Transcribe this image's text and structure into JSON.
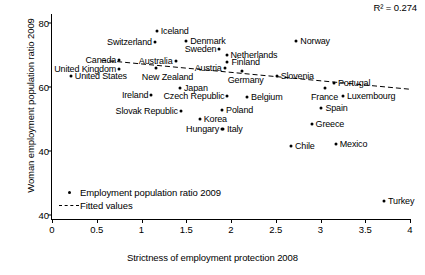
{
  "chart_data": {
    "type": "scatter",
    "title": "",
    "xlabel": "Strictness of employment protection 2008",
    "ylabel": "Woman employment population ratio 2009",
    "xlim": [
      0,
      4
    ],
    "ylim": [
      40,
      80
    ],
    "xticks": [
      "0",
      "0.5",
      "1",
      "1.5",
      "2",
      "2.5",
      "3",
      "3.5",
      "4"
    ],
    "xtick_values": [
      0,
      0.5,
      1,
      1.5,
      2,
      2.5,
      3,
      3.5,
      4
    ],
    "yticks": [
      "80",
      "60",
      "40",
      "40"
    ],
    "ytick_values": [
      80,
      60,
      40,
      20
    ],
    "grid": false,
    "annotation": "R² = 0.274",
    "legend_position": "bottom-left",
    "legend": [
      {
        "key": "marker",
        "label": "Employment population ratio 2009"
      },
      {
        "key": "dashed-line",
        "label": "Fitted values"
      }
    ],
    "series": [
      {
        "name": "Employment population ratio 2009",
        "points": [
          {
            "label": "Iceland",
            "x": 1.17,
            "y": 77.6,
            "label_side": "right"
          },
          {
            "label": "Switzerland",
            "x": 1.15,
            "y": 74.2,
            "label_side": "left"
          },
          {
            "label": "Denmark",
            "x": 1.5,
            "y": 74.4,
            "label_side": "right"
          },
          {
            "label": "Norway",
            "x": 2.73,
            "y": 74.4,
            "label_side": "right"
          },
          {
            "label": "Sweden",
            "x": 1.87,
            "y": 72.0,
            "label_side": "left"
          },
          {
            "label": "Netherlands",
            "x": 1.95,
            "y": 70.0,
            "label_side": "right"
          },
          {
            "label": "Canada",
            "x": 0.75,
            "y": 68.5,
            "label_side": "left"
          },
          {
            "label": "Australia",
            "x": 1.38,
            "y": 68.1,
            "label_side": "left"
          },
          {
            "label": "Finland",
            "x": 1.96,
            "y": 67.9,
            "label_side": "right"
          },
          {
            "label": "New Zealand",
            "x": 1.16,
            "y": 66.0,
            "label_side": "below"
          },
          {
            "label": "United Kingdom",
            "x": 0.75,
            "y": 65.5,
            "label_side": "left"
          },
          {
            "label": "Austria",
            "x": 1.93,
            "y": 66.0,
            "label_side": "left"
          },
          {
            "label": "Germany",
            "x": 2.12,
            "y": 64.9,
            "label_side": "below"
          },
          {
            "label": "United States",
            "x": 0.21,
            "y": 63.4,
            "label_side": "right"
          },
          {
            "label": "Slovenia",
            "x": 2.51,
            "y": 63.4,
            "label_side": "right"
          },
          {
            "label": "Portugal",
            "x": 3.15,
            "y": 61.3,
            "label_side": "right"
          },
          {
            "label": "Japan",
            "x": 1.43,
            "y": 59.8,
            "label_side": "right"
          },
          {
            "label": "France",
            "x": 3.05,
            "y": 59.7,
            "label_side": "below"
          },
          {
            "label": "Ireland",
            "x": 1.11,
            "y": 57.4,
            "label_side": "left"
          },
          {
            "label": "Czech Republic",
            "x": 1.96,
            "y": 57.3,
            "label_side": "left"
          },
          {
            "label": "Belgium",
            "x": 2.18,
            "y": 56.8,
            "label_side": "right"
          },
          {
            "label": "Luxembourg",
            "x": 3.25,
            "y": 57.2,
            "label_side": "right"
          },
          {
            "label": "Poland",
            "x": 1.9,
            "y": 52.8,
            "label_side": "right"
          },
          {
            "label": "Slovak Republic",
            "x": 1.44,
            "y": 52.5,
            "label_side": "left"
          },
          {
            "label": "Spain",
            "x": 3.01,
            "y": 53.3,
            "label_side": "right"
          },
          {
            "label": "Korea",
            "x": 1.65,
            "y": 50.0,
            "label_side": "right"
          },
          {
            "label": "Greece",
            "x": 2.9,
            "y": 48.4,
            "label_side": "right"
          },
          {
            "label": "Hungary",
            "x": 1.9,
            "y": 47.0,
            "label_side": "left"
          },
          {
            "label": "Italy",
            "x": 1.91,
            "y": 46.9,
            "label_side": "right"
          },
          {
            "label": "Chile",
            "x": 2.67,
            "y": 41.5,
            "label_side": "right"
          },
          {
            "label": "Mexico",
            "x": 3.17,
            "y": 42.3,
            "label_side": "right"
          },
          {
            "label": "Turkey",
            "x": 3.71,
            "y": 24.3,
            "label_side": "right"
          }
        ]
      }
    ],
    "fit_line": {
      "name": "Fitted values",
      "style": "dashed",
      "x": [
        0.55,
        4.0
      ],
      "y": [
        68.4,
        59.3
      ]
    }
  }
}
